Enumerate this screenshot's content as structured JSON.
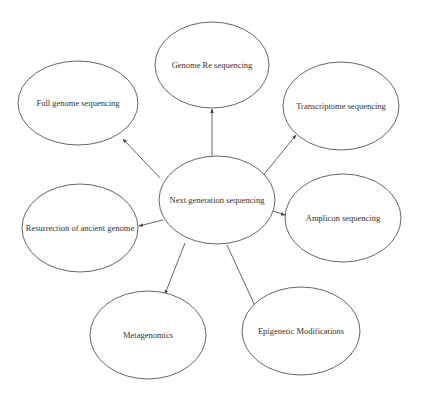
{
  "diagram": {
    "type": "hub-and-spoke mind map",
    "center": {
      "id": "ngs",
      "label": "Next generation sequencing",
      "cx": 217,
      "cy": 200,
      "rx": 58,
      "ry": 44
    },
    "nodes": [
      {
        "id": "genome-re",
        "label": "Genome Re sequencing",
        "cx": 212,
        "cy": 65,
        "rx": 57,
        "ry": 43
      },
      {
        "id": "full-genome",
        "label": "Full genome sequencing",
        "cx": 78,
        "cy": 103,
        "rx": 60,
        "ry": 42
      },
      {
        "id": "transcriptome",
        "label": "Transcriptome sequencing",
        "cx": 341,
        "cy": 106,
        "rx": 58,
        "ry": 44
      },
      {
        "id": "resurrection",
        "label": "Resurrection of ancient genome",
        "cx": 80,
        "cy": 228,
        "rx": 58,
        "ry": 44
      },
      {
        "id": "amplicon",
        "label": "Amplicon sequencing",
        "cx": 343,
        "cy": 218,
        "rx": 58,
        "ry": 44
      },
      {
        "id": "metagenomics",
        "label": "Metagenomics",
        "cx": 148,
        "cy": 335,
        "rx": 58,
        "ry": 44
      },
      {
        "id": "epigenetic",
        "label": "Epigenetic Modifications",
        "cx": 301,
        "cy": 331,
        "rx": 59,
        "ry": 44
      }
    ],
    "edges": [
      {
        "from": "ngs",
        "to": "genome-re",
        "x1": 212,
        "y1": 156,
        "x2": 212,
        "y2": 109
      },
      {
        "from": "ngs",
        "to": "full-genome",
        "x1": 160,
        "y1": 178,
        "x2": 123,
        "y2": 139
      },
      {
        "from": "ngs",
        "to": "transcriptome",
        "x1": 261,
        "y1": 178,
        "x2": 296,
        "y2": 135
      },
      {
        "from": "ngs",
        "to": "resurrection",
        "x1": 163,
        "y1": 220,
        "x2": 139,
        "y2": 226
      },
      {
        "from": "ngs",
        "to": "amplicon",
        "x1": 270,
        "y1": 210,
        "x2": 285,
        "y2": 215
      },
      {
        "from": "ngs",
        "to": "metagenomics",
        "x1": 185,
        "y1": 243,
        "x2": 165,
        "y2": 294
      },
      {
        "from": "ngs",
        "to": "epigenetic",
        "x1": 227,
        "y1": 245,
        "x2": 256,
        "y2": 308
      }
    ],
    "colors": {
      "stroke": "#555555",
      "text": "#333333",
      "background": "#ffffff"
    }
  }
}
